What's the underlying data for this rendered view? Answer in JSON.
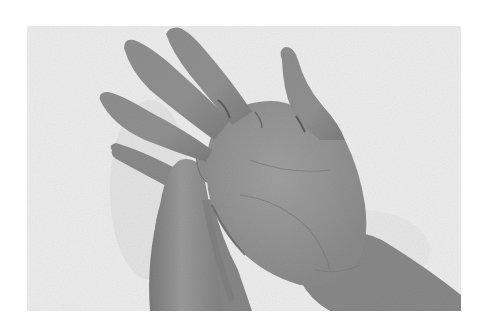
{
  "image": {
    "description": "Grayscale photograph of two hands on a white textured towel; one hand's thumb presses into the palm of the other, open hand.",
    "colors": {
      "page_background": "#ffffff",
      "towel": "#ececec",
      "towel_shadow": "#dcdcdc",
      "skin": "#8c8c8c",
      "skin_light": "#9c9c9c",
      "skin_dark": "#6e6e6e",
      "crease": "#5a5a5a"
    },
    "photo_bounds": {
      "x": 27,
      "y": 26,
      "width": 434,
      "height": 285
    }
  }
}
